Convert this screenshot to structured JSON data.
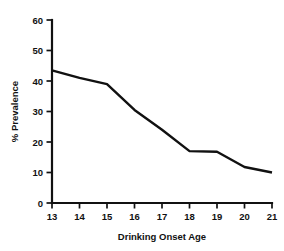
{
  "chart_data": {
    "type": "line",
    "title": "",
    "subtitle": "",
    "xlabel": "Drinking Onset Age",
    "ylabel": "% Prevalence",
    "x": [
      13,
      14,
      15,
      16,
      17,
      18,
      19,
      20,
      21
    ],
    "values": [
      43.5,
      41.0,
      39.0,
      30.5,
      24.0,
      17.0,
      16.8,
      11.8,
      10.0
    ],
    "series": [
      {
        "name": "Prevalence",
        "values": [
          43.5,
          41.0,
          39.0,
          30.5,
          24.0,
          17.0,
          16.8,
          11.8,
          10.0
        ],
        "color": "#111111"
      }
    ],
    "xlim": [
      13,
      21
    ],
    "ylim": [
      0,
      60
    ],
    "xticks": [
      "13",
      "14",
      "15",
      "16",
      "17",
      "18",
      "19",
      "20",
      "21"
    ],
    "yticks": [
      "0",
      "10",
      "20",
      "30",
      "40",
      "50",
      "60"
    ],
    "ytick_values": [
      0,
      10,
      20,
      30,
      40,
      50,
      60
    ],
    "grid": false,
    "legend": false,
    "legend_position": "none",
    "line_color": "#111111",
    "background_color": "#ffffff",
    "axis_color": "#111111"
  },
  "axes": {
    "y_title": "% Prevalence",
    "x_title": "Drinking Onset Age"
  },
  "caption": {
    "text": ""
  }
}
